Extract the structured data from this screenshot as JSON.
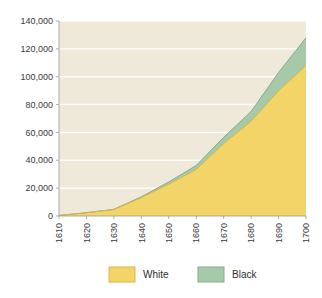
{
  "chart_data": {
    "type": "area",
    "stacked": true,
    "title": "",
    "xlabel": "",
    "ylabel": "",
    "categories": [
      1610,
      1620,
      1630,
      1640,
      1650,
      1660,
      1670,
      1680,
      1690,
      1700
    ],
    "x_tick_labels": [
      "1610",
      "1620",
      "1630",
      "1640",
      "1650",
      "1660",
      "1670",
      "1680",
      "1690",
      "1700"
    ],
    "y_tick_labels": [
      "0",
      "20,000",
      "40,000",
      "60,000",
      "80,000",
      "100,000",
      "120,000",
      "140,000"
    ],
    "y_tick_values": [
      0,
      20000,
      40000,
      60000,
      80000,
      100000,
      120000,
      140000
    ],
    "xlim": [
      1610,
      1700
    ],
    "ylim": [
      0,
      140000
    ],
    "grid": true,
    "grid_orientation": "horizontal",
    "legend_position": "bottom",
    "series": [
      {
        "name": "White",
        "color": "#f3d468",
        "border_color": "#d9b744",
        "values": [
          350,
          2300,
          4600,
          13200,
          22800,
          33400,
          52000,
          68000,
          90000,
          108000
        ]
      },
      {
        "name": "Black",
        "color": "#a6c9aa",
        "border_color": "#87ad8c",
        "values": [
          50,
          100,
          200,
          600,
          1600,
          2900,
          4500,
          7000,
          13000,
          20000
        ]
      }
    ],
    "plot_background": "#efe9da",
    "gridline_color": "#ffffff",
    "axis_color": "#9a9a9a"
  },
  "legend": {
    "items": [
      {
        "label": "White",
        "color": "#f3d468",
        "border": "#d9b744"
      },
      {
        "label": "Black",
        "color": "#a6c9aa",
        "border": "#87ad8c"
      }
    ]
  }
}
